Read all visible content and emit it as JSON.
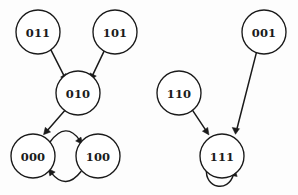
{
  "diagram": {
    "background_color": "#fdfdfd",
    "stroke_color": "#1a1a1a",
    "node_fill_color": "#ffffff",
    "node_radius": 22,
    "nodes": [
      {
        "id": "011",
        "label": "011",
        "cx": 38,
        "cy": 32
      },
      {
        "id": "101",
        "label": "101",
        "cx": 115,
        "cy": 32
      },
      {
        "id": "010",
        "label": "010",
        "cx": 78,
        "cy": 93
      },
      {
        "id": "000",
        "label": "000",
        "cx": 33,
        "cy": 156
      },
      {
        "id": "100",
        "label": "100",
        "cx": 98,
        "cy": 156
      },
      {
        "id": "110",
        "label": "110",
        "cx": 179,
        "cy": 93
      },
      {
        "id": "001",
        "label": "001",
        "cx": 264,
        "cy": 32
      },
      {
        "id": "111",
        "label": "111",
        "cx": 222,
        "cy": 156
      }
    ],
    "edges": [
      {
        "from": "011",
        "to": "010",
        "kind": "straight"
      },
      {
        "from": "101",
        "to": "010",
        "kind": "straight"
      },
      {
        "from": "010",
        "to": "000",
        "kind": "straight"
      },
      {
        "from": "000",
        "to": "100",
        "kind": "curve-top"
      },
      {
        "from": "100",
        "to": "000",
        "kind": "curve-bottom"
      },
      {
        "from": "110",
        "to": "111",
        "kind": "straight"
      },
      {
        "from": "001",
        "to": "111",
        "kind": "straight"
      },
      {
        "from": "111",
        "to": "111",
        "kind": "self-loop"
      }
    ]
  }
}
